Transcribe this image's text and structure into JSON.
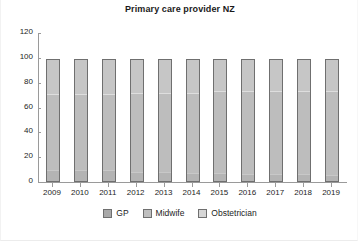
{
  "chart_data": {
    "type": "bar",
    "title": "Primary care provider NZ",
    "xlabel": "",
    "ylabel": "",
    "stacked": true,
    "grid": false,
    "legend_position": "bottom",
    "ylim": [
      0,
      120
    ],
    "yticks": [
      0,
      20,
      40,
      60,
      80,
      100,
      120
    ],
    "categories": [
      "2009",
      "2010",
      "2011",
      "2012",
      "2013",
      "2014",
      "2015",
      "2016",
      "2017",
      "2018",
      "2019"
    ],
    "series": [
      {
        "name": "GP",
        "color": "#a9a9a9",
        "values": [
          8,
          8,
          8,
          7,
          7,
          6,
          6,
          5,
          5,
          5,
          4
        ]
      },
      {
        "name": "Midwife",
        "color": "#bfbfbf",
        "values": [
          63,
          63,
          63,
          65,
          65,
          66,
          67,
          68,
          68,
          68,
          69
        ]
      },
      {
        "name": "Obstetrician",
        "color": "#d6d6d6",
        "values": [
          28,
          28,
          28,
          27,
          27,
          27,
          26,
          26,
          26,
          26,
          26
        ]
      }
    ],
    "totals": [
      99,
      99,
      99,
      99,
      99,
      99,
      99,
      99,
      99,
      99,
      99
    ]
  },
  "legend": {
    "items": [
      {
        "label": "GP",
        "swatch_class": "sw-gp"
      },
      {
        "label": "Midwife",
        "swatch_class": "sw-midwife"
      },
      {
        "label": "Obstetrician",
        "swatch_class": "sw-obs"
      }
    ]
  },
  "colors": {
    "axis": "#9a9a9a",
    "text": "#1d1d1d",
    "background": "#ffffff",
    "bar_outline": "#6f6f6f"
  }
}
